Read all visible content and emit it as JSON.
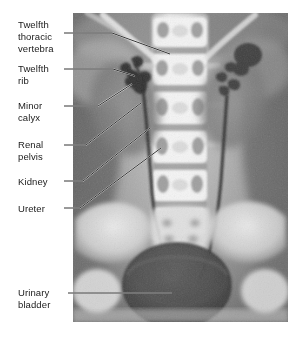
{
  "figure": {
    "kind": "labeled-radiograph",
    "modality": "radiograph",
    "view": "anteroposterior"
  },
  "image": {
    "alt_name": "urinary-system-radiograph",
    "frame_color": "#9a9a9a"
  },
  "labels": [
    {
      "id": "twelfth-thoracic-vertebra",
      "text": "Twelfth\nthoracic\nvertebra",
      "x": 18,
      "y": 19
    },
    {
      "id": "twelfth-rib",
      "text": "Twelfth\nrib",
      "x": 18,
      "y": 63
    },
    {
      "id": "minor-calyx",
      "text": "Minor\ncalyx",
      "x": 18,
      "y": 100
    },
    {
      "id": "renal-pelvis",
      "text": "Renal\npelvis",
      "x": 18,
      "y": 139
    },
    {
      "id": "kidney",
      "text": "Kidney",
      "x": 18,
      "y": 176
    },
    {
      "id": "ureter",
      "text": "Ureter",
      "x": 18,
      "y": 203
    },
    {
      "id": "urinary-bladder",
      "text": "Urinary\nbladder",
      "x": 18,
      "y": 287
    }
  ],
  "leaders": [
    {
      "id": "leader-twelfth-thoracic-vertebra",
      "points": "64,33 112,33 170,54"
    },
    {
      "id": "leader-twelfth-rib",
      "points": "64,69 113,69 135,76"
    },
    {
      "id": "leader-minor-calyx",
      "points": "64,106 98,106 132,84"
    },
    {
      "id": "leader-renal-pelvis",
      "points": "64,145 86,145 141,103"
    },
    {
      "id": "leader-kidney",
      "points": "64,181 83,181 150,128"
    },
    {
      "id": "leader-ureter",
      "points": "64,208 80,208 161,148"
    },
    {
      "id": "leader-urinary-bladder",
      "points": "68,293 172,293"
    }
  ],
  "colors": {
    "text": "#1a1a1a",
    "leader_line": "#000000",
    "leader_line_on_image": "#ffffff",
    "background": "#ffffff"
  }
}
